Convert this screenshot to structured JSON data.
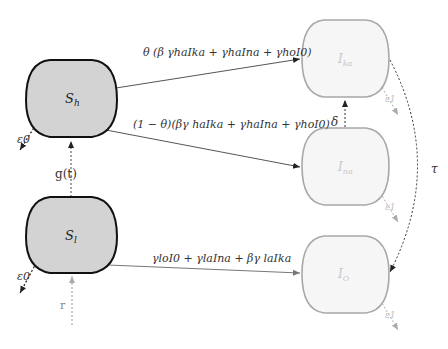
{
  "diagram": {
    "type": "compartmental-flow",
    "colors": {
      "susceptible_fill": "#d3d3d3",
      "susceptible_stroke": "#111111",
      "infected_fill": "#f6f6f6",
      "infected_stroke": "#a8a8a8",
      "edge": "#555555",
      "faint_text": "#c8c8c8",
      "text": "#333333"
    },
    "nodes": [
      {
        "id": "Sh",
        "label": "S",
        "sub": "h",
        "kind": "susceptible"
      },
      {
        "id": "Sl",
        "label": "S",
        "sub": "l",
        "kind": "susceptible"
      },
      {
        "id": "Ika",
        "label": "I",
        "sub": "ka",
        "kind": "infected"
      },
      {
        "id": "Ina",
        "label": "I",
        "sub": "na",
        "kind": "infected"
      },
      {
        "id": "IO",
        "label": "I",
        "sub": "O",
        "kind": "infected"
      }
    ],
    "edges": {
      "sh_to_ika": "θ (β γhaIka + γhaIna + γhoI0)",
      "sh_to_ina": "(1 − θ)(βγ haIka + γhaIna + γhoI0)",
      "sl_to_io": "γloI0 + γlaIna + βγ laIka",
      "sl_to_sh": "g(t)",
      "in_to_sl": "r",
      "ina_to_ika": "δ",
      "ika_to_io": "τ",
      "sh_out": "ε0",
      "sl_out": "ε0",
      "ika_out": "ε1",
      "ina_out": "ε1",
      "io_out": "ε1"
    }
  }
}
